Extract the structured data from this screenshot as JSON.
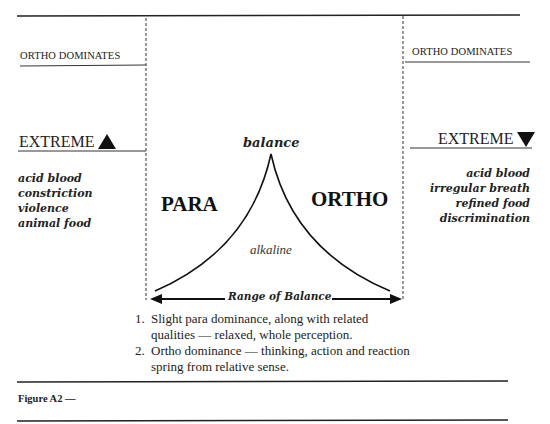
{
  "diagram": {
    "left_panel": {
      "top_label": "ORTHO DOMINATES",
      "extreme_label": "EXTREME",
      "extreme_icon": "triangle-up",
      "traits": [
        "acid blood",
        "constriction",
        "violence",
        "animal food"
      ]
    },
    "right_panel": {
      "top_label": "ORTHO DOMINATES",
      "extreme_label": "EXTREME",
      "extreme_icon": "triangle-down",
      "traits": [
        "acid blood",
        "irregular breath",
        "refined food",
        "discrimination"
      ]
    },
    "center": {
      "peak_label": "balance",
      "left_label": "PARA",
      "right_label": "ORTHO",
      "inner_label": "alkaline",
      "range_label": "Range of Balance"
    },
    "notes": [
      {
        "number": "1.",
        "lines": [
          "Slight para dominance, along with related",
          "qualities — relaxed, whole perception."
        ]
      },
      {
        "number": "2.",
        "lines": [
          "Ortho dominance — thinking, action and reaction",
          "spring from relative sense."
        ]
      }
    ],
    "caption": "Figure A2 —"
  }
}
